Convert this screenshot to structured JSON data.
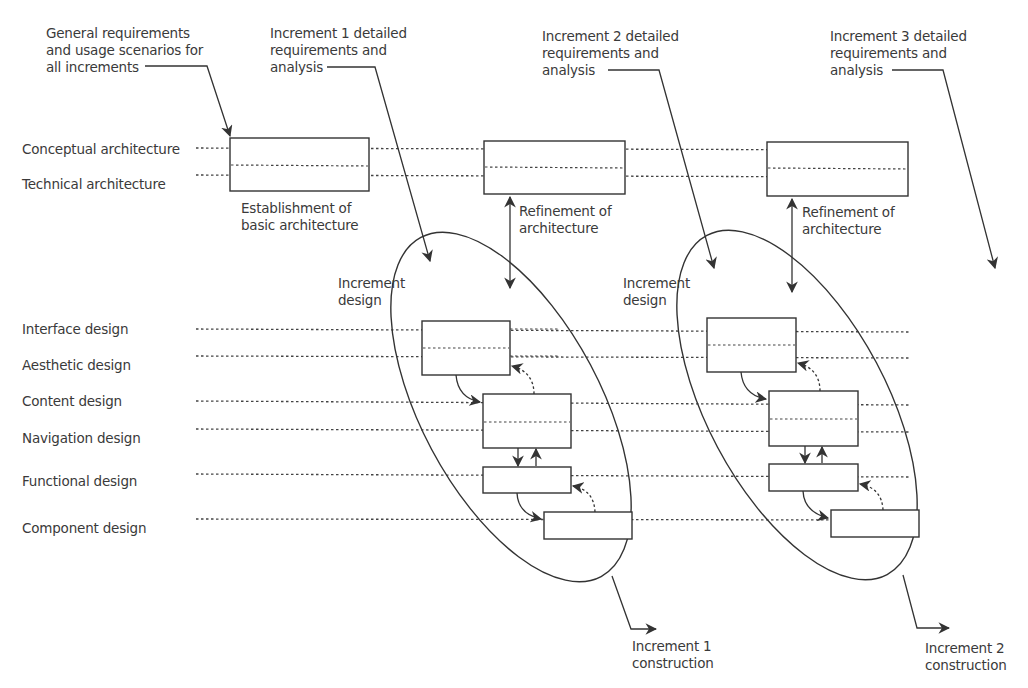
{
  "diagram": {
    "type": "incremental web design process",
    "faint_header": "…ture 17",
    "row_labels": [
      {
        "id": "conceptual",
        "label": "Conceptual architecture"
      },
      {
        "id": "technical",
        "label": "Technical architecture"
      },
      {
        "id": "interface",
        "label": "Interface design"
      },
      {
        "id": "aesthetic",
        "label": "Aesthetic design"
      },
      {
        "id": "content",
        "label": "Content design"
      },
      {
        "id": "navigation",
        "label": "Navigation design"
      },
      {
        "id": "functional",
        "label": "Functional design"
      },
      {
        "id": "component",
        "label": "Component design"
      }
    ],
    "annotations": {
      "general_requirements": "General requirements\nand usage scenarios for\nall increments",
      "inc1_requirements": "Increment 1 detailed\nrequirements and\nanalysis",
      "inc2_requirements": "Increment 2 detailed\nrequirements and\nanalysis",
      "inc3_requirements": "Increment 3 detailed\nrequirements and\nanalysis",
      "basic_architecture": "Establishment of\nbasic architecture",
      "refinement_1": "Refinement of\narchitecture",
      "refinement_2": "Refinement of\narchitecture",
      "increment_design_1": "Increment\ndesign",
      "increment_design_2": "Increment\ndesign",
      "inc1_construction": "Increment 1\nconstruction",
      "inc2_construction": "Increment 2\nconstruction"
    },
    "colors": {
      "stroke": "#333333",
      "text": "#3a3a3a",
      "background": "#ffffff"
    }
  }
}
